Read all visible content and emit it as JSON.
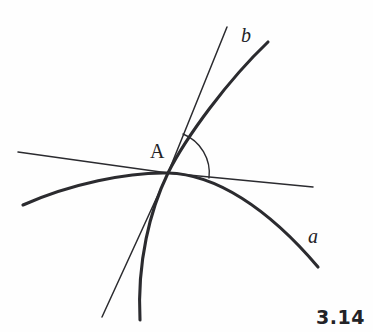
{
  "figure": {
    "caption": "3.14",
    "background_color": "#fefefe",
    "stroke_color": "#2b2b2f",
    "width": 373,
    "height": 332,
    "labels": {
      "point_a": "A",
      "curve_a": "a",
      "curve_b": "b"
    },
    "geometry": {
      "intersection_point": {
        "name": "A",
        "x": 168,
        "y": 173
      },
      "curve_a": {
        "name": "a",
        "kind": "thick-curve",
        "description": "downward-opening arc passing through A, concave down",
        "start": {
          "x": 23,
          "y": 205
        },
        "end": {
          "x": 318,
          "y": 267
        },
        "path": "M 23 205 C 70 184 128 172 168 173 C 215 174 268 208 318 267"
      },
      "curve_b": {
        "name": "b",
        "kind": "thick-curve",
        "description": "steep curve through A bending right toward the upper right",
        "start": {
          "x": 140,
          "y": 320
        },
        "end": {
          "x": 268,
          "y": 42
        },
        "path": "M 140 320 C 137 262 150 210 168 173 C 186 137 228 80 268 42"
      },
      "secant_line": {
        "name": "secant",
        "kind": "thin-line",
        "description": "straight line through A from lower left to upper right",
        "start": {
          "x": 102,
          "y": 317
        },
        "end": {
          "x": 227,
          "y": 27
        },
        "path": "M 102 317 L 168 173 L 227 27"
      },
      "tangent_line": {
        "name": "tangent",
        "kind": "thin-line",
        "description": "nearly horizontal straight line through A from left to right",
        "start": {
          "x": 18,
          "y": 152
        },
        "end": {
          "x": 313,
          "y": 187
        },
        "path": "M 18 152 L 168 173 L 313 187"
      },
      "angle_arc": {
        "name": "angle-at-a",
        "description": "arc marking the angle between the secant line and the horizontal line at A",
        "center": {
          "x": 168,
          "y": 173
        },
        "radius": 42,
        "path": "M 183 134 A 42 42 0 0 1 209 178"
      }
    }
  }
}
